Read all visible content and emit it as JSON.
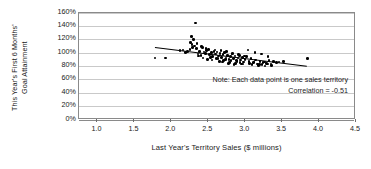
{
  "chart_data": {
    "type": "scatter",
    "title": "",
    "xlabel": "Last Year's Territory Sales ($ millions)",
    "ylabel_line1": "This Year's First 6 Months'",
    "ylabel_line2": "Goal Attainment",
    "xlim": [
      0.75,
      4.5
    ],
    "ylim": [
      0,
      1.6
    ],
    "xticks": [
      "1.0",
      "1.5",
      "2.0",
      "2.5",
      "3.0",
      "3.5",
      "4.0",
      "4.5"
    ],
    "xtick_values": [
      1.0,
      1.5,
      2.0,
      2.5,
      3.0,
      3.5,
      4.0,
      4.5
    ],
    "yticks": [
      "0%",
      "20%",
      "40%",
      "60%",
      "80%",
      "100%",
      "120%",
      "140%",
      "160%"
    ],
    "ytick_values": [
      0,
      0.2,
      0.4,
      0.6,
      0.8,
      1.0,
      1.2,
      1.4,
      1.6
    ],
    "grid": "horizontal",
    "legend": "none",
    "marker_color": "#000000",
    "gridline_color": "#c9c9c9",
    "frame_color": "#8a8a8a",
    "annotations": [
      "Note: Each data point is one sales territory",
      "Correlation = -0.51"
    ],
    "correlation": -0.51,
    "trendline": {
      "type": "linear",
      "x_start": 1.78,
      "y_start": 1.08,
      "x_end": 3.84,
      "y_end": 0.8
    },
    "x": [
      1.78,
      1.92,
      2.33,
      2.27,
      2.3,
      2.12,
      2.16,
      2.19,
      2.22,
      2.25,
      2.28,
      2.31,
      2.34,
      2.36,
      2.38,
      2.4,
      2.42,
      2.44,
      2.46,
      2.48,
      2.5,
      2.52,
      2.54,
      2.56,
      2.58,
      2.6,
      2.62,
      2.64,
      2.66,
      2.68,
      2.7,
      2.72,
      2.74,
      2.76,
      2.78,
      2.8,
      2.82,
      2.84,
      2.86,
      2.88,
      2.9,
      2.92,
      2.94,
      2.96,
      2.98,
      3.0,
      3.02,
      3.05,
      3.08,
      3.11,
      3.14,
      3.17,
      3.2,
      3.23,
      3.26,
      3.29,
      3.32,
      3.35,
      3.38,
      3.42,
      3.46,
      3.52,
      3.84,
      2.26,
      2.29,
      2.35,
      2.41,
      2.47,
      2.53,
      2.59,
      2.63,
      2.67,
      2.71,
      2.75,
      2.79,
      2.83,
      2.87,
      2.91,
      2.95,
      2.99,
      3.04,
      3.09,
      3.13,
      3.18,
      3.22,
      3.27,
      3.31,
      3.36,
      2.37,
      2.43,
      2.49,
      2.55,
      2.61,
      2.65,
      2.69,
      2.73,
      2.77,
      2.81,
      2.85,
      2.89,
      2.93,
      2.97,
      3.06,
      3.12,
      3.19,
      3.24,
      3.3
    ],
    "y": [
      0.92,
      0.92,
      1.44,
      1.24,
      1.2,
      1.03,
      1.04,
      1.0,
      1.02,
      1.05,
      1.12,
      1.1,
      1.06,
      0.98,
      1.02,
      0.96,
      1.08,
      1.01,
      0.99,
      1.03,
      1.05,
      0.97,
      1.0,
      0.94,
      1.02,
      0.98,
      1.01,
      0.95,
      0.99,
      0.93,
      0.97,
      1.0,
      0.92,
      0.96,
      0.9,
      0.94,
      0.98,
      0.91,
      0.95,
      0.88,
      0.92,
      0.96,
      0.89,
      0.93,
      0.86,
      0.9,
      0.94,
      0.87,
      0.91,
      0.85,
      0.89,
      0.83,
      0.87,
      0.82,
      0.86,
      0.84,
      0.88,
      0.83,
      0.87,
      0.85,
      0.86,
      0.87,
      0.91,
      1.15,
      1.08,
      1.14,
      1.09,
      1.06,
      0.93,
      1.04,
      0.91,
      1.03,
      0.88,
      1.02,
      0.85,
      0.99,
      0.84,
      0.97,
      0.83,
      0.95,
      1.04,
      0.82,
      1.0,
      0.81,
      0.98,
      0.8,
      0.94,
      0.81,
      0.95,
      0.92,
      0.9,
      0.89,
      0.91,
      0.87,
      0.86,
      0.9,
      0.84,
      0.88,
      0.82,
      0.87,
      0.85,
      0.83,
      0.84,
      0.86,
      0.82,
      0.85,
      0.83
    ]
  }
}
